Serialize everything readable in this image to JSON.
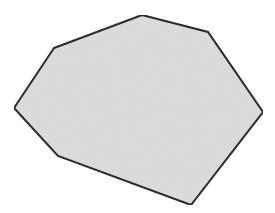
{
  "canvas": {
    "width": 275,
    "height": 213,
    "background": "#ffffff"
  },
  "shape": {
    "type": "polygon",
    "sides": 7,
    "name": "irregular heptagon",
    "points": [
      [
        54,
        48
      ],
      [
        142,
        15
      ],
      [
        208,
        32
      ],
      [
        263,
        112
      ],
      [
        191,
        205
      ],
      [
        58,
        156
      ],
      [
        14,
        108
      ]
    ],
    "fill": "#dcdcdc",
    "stroke": "#1a1a1a",
    "stroke_width": 2
  }
}
